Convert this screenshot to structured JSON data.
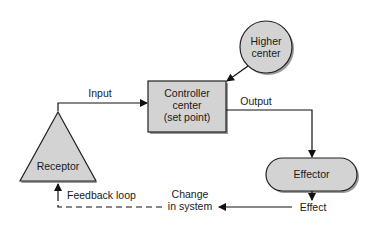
{
  "diagram": {
    "type": "feedback-loop-flowchart",
    "colors": {
      "fill": "#d3d3d3",
      "stroke": "#222222",
      "shadow": "#9a9a9a",
      "text": "#1a1a1a",
      "background": "#ffffff"
    },
    "nodes": {
      "higher_center": {
        "label_line1": "Higher",
        "label_line2": "center",
        "shape": "circle"
      },
      "controller": {
        "label_line1": "Controller",
        "label_line2": "center",
        "label_line3": "(set point)",
        "shape": "rectangle"
      },
      "effector": {
        "label": "Effector",
        "shape": "rounded-pill"
      },
      "receptor": {
        "label": "Receptor",
        "shape": "triangle"
      }
    },
    "edges": {
      "input": "Input",
      "output": "Output",
      "effect": "Effect",
      "change_line1": "Change",
      "change_line2": "in system",
      "feedback": "Feedback loop"
    }
  }
}
